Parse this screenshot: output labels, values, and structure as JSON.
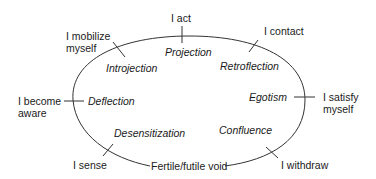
{
  "diagram": {
    "center_label": "Fertile/futile void",
    "stages": [
      {
        "stage": "I sense",
        "interruption": "Desensitization"
      },
      {
        "stage": "I become aware",
        "interruption": "Deflection"
      },
      {
        "stage": "I mobilize myself",
        "interruption": "Introjection"
      },
      {
        "stage": "I act",
        "interruption": "Projection"
      },
      {
        "stage": "I contact",
        "interruption": "Retroflection"
      },
      {
        "stage": "I satisfy myself",
        "interruption": "Egotism"
      },
      {
        "stage": "I withdraw",
        "interruption": "Confluence"
      }
    ],
    "labels": {
      "i_act": "I act",
      "i_mobilize_1": "I mobilize",
      "i_mobilize_2": "myself",
      "i_contact": "I contact",
      "i_become_1": "I become",
      "i_become_2": "aware",
      "i_satisfy_1": "I satisfy",
      "i_satisfy_2": "myself",
      "i_sense": "I sense",
      "i_withdraw": "I withdraw",
      "void": "Fertile/futile void",
      "projection": "Projection",
      "introjection": "Introjection",
      "retroflection": "Retroflection",
      "deflection": "Deflection",
      "egotism": "Egotism",
      "desensitization": "Desensitization",
      "confluence": "Confluence"
    },
    "colors": {
      "line": "#333333",
      "text": "#1a1a1a",
      "background": "#ffffff"
    }
  }
}
